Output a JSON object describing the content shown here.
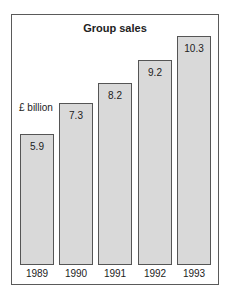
{
  "chart_data": {
    "type": "bar",
    "title": "Group sales",
    "ylabel": "£ billion",
    "xlabel": "",
    "categories": [
      "1989",
      "1990",
      "1991",
      "1992",
      "1993"
    ],
    "values": [
      5.9,
      7.3,
      8.2,
      9.2,
      10.3
    ],
    "value_labels": [
      "5.9",
      "7.3",
      "8.2",
      "9.2",
      "10.3"
    ],
    "ylim": [
      0,
      10.3
    ],
    "grid": false,
    "legend": null,
    "colors": {
      "bar_fill": "#d9d9d9",
      "bar_border": "#555555",
      "frame": "#5a5a5a"
    }
  }
}
